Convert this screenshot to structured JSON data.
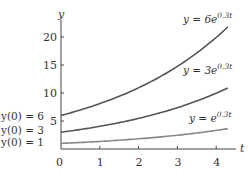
{
  "chart_data": {
    "type": "line",
    "title": "",
    "xlabel": "t",
    "ylabel": "y",
    "xlim": [
      0,
      4.3
    ],
    "ylim": [
      0,
      22
    ],
    "grid": false,
    "x_ticks": [
      "0",
      "1",
      "2",
      "3",
      "4"
    ],
    "y_ticks": [
      "5",
      "10",
      "15",
      "20"
    ],
    "x": [
      0,
      0.5,
      1,
      1.5,
      2,
      2.5,
      3,
      3.5,
      4,
      4.3
    ],
    "series": [
      {
        "name": "y = 6e^{0.3t}",
        "label_main": "y = 6e",
        "label_exp": "0.3t",
        "initial_label": "y(0) = 6",
        "y0": 6,
        "values": [
          6.0,
          6.97,
          8.1,
          9.41,
          10.93,
          12.7,
          14.76,
          17.15,
          19.92,
          21.83
        ],
        "color": "#555555"
      },
      {
        "name": "y = 3e^{0.3t}",
        "label_main": "y = 3e",
        "label_exp": "0.3t",
        "initial_label": "y(0) = 3",
        "y0": 3,
        "values": [
          3.0,
          3.49,
          4.05,
          4.7,
          5.47,
          6.35,
          7.38,
          8.57,
          9.96,
          10.92
        ],
        "color": "#555555"
      },
      {
        "name": "y = e^{0.3t}",
        "label_main": "y = e",
        "label_exp": "0.3t",
        "initial_label": "y(0) = 1",
        "y0": 1,
        "values": [
          1.0,
          1.16,
          1.35,
          1.57,
          1.82,
          2.12,
          2.46,
          2.86,
          3.32,
          3.64
        ],
        "color": "#888888"
      }
    ],
    "annotations": [
      "y(0) = 6",
      "y(0) = 3",
      "y(0) = 1"
    ],
    "legend_position": "inline labels at right end of curves"
  },
  "axes": {
    "x_name": "t",
    "y_name": "y",
    "origin_label": "0"
  }
}
